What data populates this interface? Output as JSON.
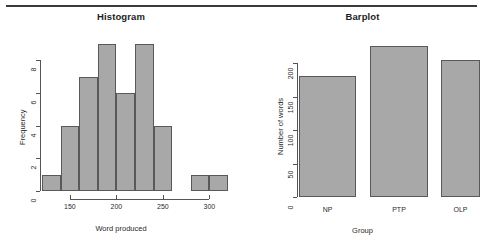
{
  "figure": {
    "background": "#ffffff",
    "bar_fill": "#a8a8a8",
    "bar_border": "#595959",
    "rule_color": "#3a3a3a"
  },
  "chart_data": [
    {
      "type": "bar",
      "subtype": "histogram",
      "title": "Histogram",
      "xlabel": "Word produced",
      "ylabel": "Frequency",
      "xlim": [
        120,
        320
      ],
      "ylim": [
        0,
        9
      ],
      "xticks": [
        150,
        200,
        250,
        300
      ],
      "xticklabels": [
        "150",
        "200",
        "250",
        "300"
      ],
      "yticks": [
        0,
        2,
        4,
        6,
        8
      ],
      "yticklabels": [
        "0",
        "2",
        "4",
        "6",
        "8"
      ],
      "grid": false,
      "legend": false,
      "bin_width": 20,
      "bins": [
        {
          "x0": 120,
          "x1": 140,
          "value": 1
        },
        {
          "x0": 140,
          "x1": 160,
          "value": 4
        },
        {
          "x0": 160,
          "x1": 180,
          "value": 7
        },
        {
          "x0": 180,
          "x1": 200,
          "value": 9
        },
        {
          "x0": 200,
          "x1": 220,
          "value": 6
        },
        {
          "x0": 220,
          "x1": 240,
          "value": 9
        },
        {
          "x0": 240,
          "x1": 260,
          "value": 4
        },
        {
          "x0": 260,
          "x1": 280,
          "value": 0
        },
        {
          "x0": 280,
          "x1": 300,
          "value": 1
        },
        {
          "x0": 300,
          "x1": 320,
          "value": 1
        }
      ]
    },
    {
      "type": "bar",
      "subtype": "barplot",
      "title": "Barplot",
      "xlabel": "Group",
      "ylabel": "Number of words",
      "ylim": [
        0,
        230
      ],
      "yticks": [
        0,
        50,
        100,
        150,
        200
      ],
      "yticklabels": [
        "0",
        "50",
        "100",
        "150",
        "200"
      ],
      "grid": false,
      "legend": false,
      "categories": [
        "NP",
        "PTP",
        "OLP"
      ],
      "values": [
        181,
        226,
        205
      ]
    }
  ]
}
